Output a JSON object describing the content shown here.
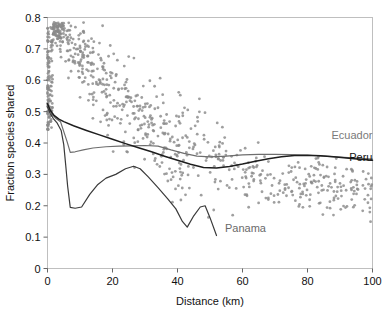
{
  "chart_data": {
    "type": "scatter",
    "title": "",
    "xlabel": "Distance (km)",
    "ylabel": "Fraction species shared",
    "xlim": [
      0,
      100
    ],
    "ylim": [
      0,
      0.8
    ],
    "xticks": [
      0,
      20,
      40,
      60,
      80,
      100
    ],
    "xtick_labels": [
      "0",
      "20",
      "40",
      "60",
      "80",
      "100"
    ],
    "yticks": [
      0,
      0.1,
      0.2,
      0.3,
      0.4,
      0.5,
      0.6,
      0.7,
      0.8
    ],
    "ytick_labels": [
      "0",
      "0.1",
      "0.2",
      "0.3",
      "0.4",
      "0.5",
      "0.6",
      "0.7",
      "0.8"
    ],
    "grid": false,
    "legend_position": "inline-right",
    "series": [
      {
        "name": "Ecuador",
        "kind": "line",
        "color": "#6e6e6e",
        "label_x": 100,
        "label_y": 0.425,
        "points": [
          [
            0.0,
            0.52
          ],
          [
            0.6,
            0.505
          ],
          [
            1.4,
            0.492
          ],
          [
            2.6,
            0.478
          ],
          [
            4.0,
            0.468
          ],
          [
            6.0,
            0.405
          ],
          [
            7.0,
            0.37
          ],
          [
            8.5,
            0.372
          ],
          [
            11.0,
            0.378
          ],
          [
            14.0,
            0.384
          ],
          [
            18.0,
            0.388
          ],
          [
            22.0,
            0.39
          ],
          [
            26.0,
            0.391
          ],
          [
            30.0,
            0.392
          ],
          [
            34.0,
            0.39
          ],
          [
            38.0,
            0.378
          ],
          [
            42.0,
            0.367
          ],
          [
            46.0,
            0.358
          ],
          [
            50.0,
            0.356
          ],
          [
            55.0,
            0.358
          ],
          [
            60.0,
            0.362
          ],
          [
            65.0,
            0.364
          ],
          [
            70.0,
            0.364
          ],
          [
            75.0,
            0.363
          ],
          [
            80.0,
            0.361
          ],
          [
            85.0,
            0.358
          ],
          [
            90.0,
            0.355
          ],
          [
            95.0,
            0.352
          ],
          [
            100.0,
            0.349
          ]
        ]
      },
      {
        "name": "Peru",
        "kind": "line",
        "color": "#1e1e1e",
        "label_x": 100,
        "label_y": 0.355,
        "points": [
          [
            0.0,
            0.525
          ],
          [
            0.8,
            0.505
          ],
          [
            2.0,
            0.488
          ],
          [
            3.5,
            0.476
          ],
          [
            5.0,
            0.468
          ],
          [
            8.0,
            0.455
          ],
          [
            12.0,
            0.44
          ],
          [
            16.0,
            0.426
          ],
          [
            20.0,
            0.412
          ],
          [
            24.0,
            0.398
          ],
          [
            28.0,
            0.385
          ],
          [
            32.0,
            0.372
          ],
          [
            36.0,
            0.358
          ],
          [
            40.0,
            0.345
          ],
          [
            44.0,
            0.332
          ],
          [
            48.0,
            0.322
          ],
          [
            52.0,
            0.32
          ],
          [
            56.0,
            0.325
          ],
          [
            60.0,
            0.333
          ],
          [
            64.0,
            0.342
          ],
          [
            68.0,
            0.35
          ],
          [
            72.0,
            0.356
          ],
          [
            76.0,
            0.36
          ],
          [
            80.0,
            0.361
          ],
          [
            84.0,
            0.359
          ],
          [
            88.0,
            0.356
          ],
          [
            92.0,
            0.352
          ],
          [
            96.0,
            0.348
          ],
          [
            100.0,
            0.345
          ]
        ]
      },
      {
        "name": "Panama",
        "kind": "line",
        "color": "#3a3a3a",
        "label_x": 54,
        "label_y": 0.128,
        "points": [
          [
            0.0,
            0.515
          ],
          [
            0.8,
            0.495
          ],
          [
            1.8,
            0.478
          ],
          [
            3.0,
            0.463
          ],
          [
            4.2,
            0.44
          ],
          [
            5.0,
            0.395
          ],
          [
            5.6,
            0.33
          ],
          [
            6.2,
            0.262
          ],
          [
            7.0,
            0.195
          ],
          [
            8.5,
            0.192
          ],
          [
            10.5,
            0.196
          ],
          [
            13.0,
            0.236
          ],
          [
            15.5,
            0.268
          ],
          [
            18.0,
            0.288
          ],
          [
            21.0,
            0.3
          ],
          [
            24.0,
            0.318
          ],
          [
            26.5,
            0.326
          ],
          [
            28.5,
            0.318
          ],
          [
            31.0,
            0.292
          ],
          [
            34.0,
            0.258
          ],
          [
            37.0,
            0.222
          ],
          [
            39.5,
            0.19
          ],
          [
            41.5,
            0.15
          ],
          [
            43.0,
            0.132
          ],
          [
            45.0,
            0.168
          ],
          [
            47.0,
            0.196
          ],
          [
            48.5,
            0.2
          ],
          [
            50.0,
            0.162
          ],
          [
            52.0,
            0.105
          ]
        ]
      }
    ],
    "scatter": {
      "name": "pairwise site comparisons",
      "color": "#8a8a8a",
      "marker": "dot",
      "marker_size": 1.4,
      "n_points": 820,
      "description": "Dense cloud of pairwise site comparisons, densest near 0 km between 0.35 and 0.70, thinning and spreading downward with increasing distance."
    }
  }
}
